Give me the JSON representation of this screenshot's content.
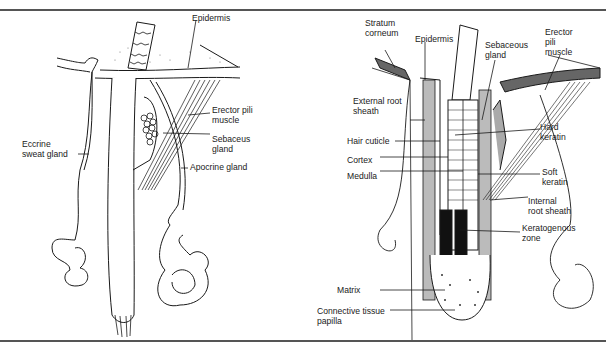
{
  "figure": {
    "panels": [
      {
        "id": "left",
        "title": "Skin appendages: hair follicle with glands",
        "labels": {
          "epidermis": "Epidermis",
          "erector_pili": "Erector pili\nmuscle",
          "sebaceous": "Sebaceus\ngland",
          "apocrine": "Apocrine gland",
          "eccrine": "Eccrine\nsweat gland"
        }
      },
      {
        "id": "right",
        "title": "Hair follicle cross-section",
        "labels": {
          "stratum_corneum": "Stratum\ncorneum",
          "epidermis": "Epidermis",
          "sebaceous": "Sebaceous\ngland",
          "erector_pili": "Erector\npili\nmuscle",
          "external_root_sheath": "External root\nsheath",
          "hair_cuticle": "Hair cuticle",
          "cortex": "Cortex",
          "medulla": "Medulla",
          "hard_keratin": "Hard\nkeratin",
          "soft_keratin": "Soft\nkeratin",
          "internal_root_sheath": "Internal\nroot sheath",
          "keratogenous_zone": "Keratogenous\nzone",
          "matrix": "Matrix",
          "connective_tissue_papilla": "Connective tissue\npapilla"
        }
      }
    ],
    "colors": {
      "ink": "#1a1a1a",
      "rule": "#555555",
      "background": "#ffffff"
    }
  }
}
